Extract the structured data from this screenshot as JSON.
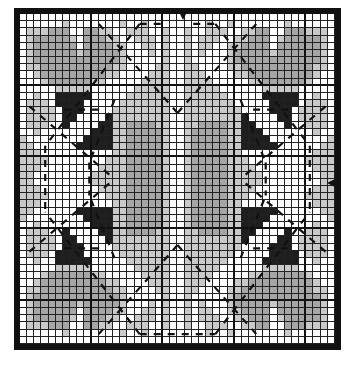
{
  "chart": {
    "title": "",
    "type": "cross-stitch-pattern-grid",
    "columns": 44,
    "rows": 46,
    "cell_px": 7.05,
    "major_grid_every": 10,
    "center_markers": [
      "top",
      "right"
    ],
    "colors": {
      "w": "#ffffff",
      "l": "#c9c9c9",
      "m": "#a6a6a6",
      "k": "#1e1e1e",
      "grid_line": "#222222",
      "border": "#111111",
      "dash": "#111111"
    },
    "legend": {
      "w": "white / background",
      "l": "light gray",
      "m": "medium gray",
      "k": "black"
    },
    "quadrant_rows": [
      "......................",
      "......l.......l..l....",
      ".lllmmm..mmll..lll..l.",
      ".lmmmmml.mmmll..lll.l.",
      ".lmmmmmm.mmmmll..ll.l.",
      ".lmmmmmmlmmmmml...l.l.",
      ".lmmmmmmmmmmmml.....l.",
      ".llmmmmmmmmmmll....ll.",
      "..lmmmmmmmmmll....lll.",
      "...lmmmmmmll.....llll.",
      ".....lllll......lllll.",
      "..l..kkkkk.....llllll.",
      ".lll.kkkk.....lllllll.",
      ".llll.kkk....llllllll.",
      ".llll.kk....kllllllll.",
      ".lll..k....kkllmmmmll.",
      "..l.......kkkllmmmmml.",
      "l........kkkkllmmmmml.",
      "ll......kkkkkllmmmmml.",
      "lll..........llmmmmml.",
      "llll........lllmmmmml.",
      "lll........llllmmmmml.",
      "ll........lllllmmmmml."
    ],
    "dashed_lines": [
      {
        "x1": 0.38,
        "y1": 0.03,
        "x2": 0.08,
        "y2": 0.4
      },
      {
        "x1": 0.62,
        "y1": 0.03,
        "x2": 0.92,
        "y2": 0.4
      },
      {
        "x1": 0.38,
        "y1": 0.97,
        "x2": 0.08,
        "y2": 0.6
      },
      {
        "x1": 0.62,
        "y1": 0.97,
        "x2": 0.92,
        "y2": 0.6
      },
      {
        "x1": 0.25,
        "y1": 0.03,
        "x2": 0.5,
        "y2": 0.3
      },
      {
        "x1": 0.75,
        "y1": 0.03,
        "x2": 0.5,
        "y2": 0.3
      },
      {
        "x1": 0.25,
        "y1": 0.97,
        "x2": 0.5,
        "y2": 0.7
      },
      {
        "x1": 0.75,
        "y1": 0.97,
        "x2": 0.5,
        "y2": 0.7
      },
      {
        "x1": 0.03,
        "y1": 0.28,
        "x2": 0.3,
        "y2": 0.5
      },
      {
        "x1": 0.03,
        "y1": 0.72,
        "x2": 0.3,
        "y2": 0.5
      },
      {
        "x1": 0.97,
        "y1": 0.28,
        "x2": 0.7,
        "y2": 0.5
      },
      {
        "x1": 0.97,
        "y1": 0.72,
        "x2": 0.7,
        "y2": 0.5
      },
      {
        "x1": 0.38,
        "y1": 0.03,
        "x2": 0.45,
        "y2": 0.03
      },
      {
        "x1": 0.55,
        "y1": 0.03,
        "x2": 0.62,
        "y2": 0.03
      },
      {
        "x1": 0.08,
        "y1": 0.4,
        "x2": 0.08,
        "y2": 0.6
      },
      {
        "x1": 0.92,
        "y1": 0.4,
        "x2": 0.92,
        "y2": 0.6
      },
      {
        "x1": 0.38,
        "y1": 0.97,
        "x2": 0.62,
        "y2": 0.97
      },
      {
        "x1": 0.14,
        "y1": 0.29,
        "x2": 0.26,
        "y2": 0.29
      },
      {
        "x1": 0.74,
        "y1": 0.29,
        "x2": 0.86,
        "y2": 0.29
      },
      {
        "x1": 0.14,
        "y1": 0.71,
        "x2": 0.26,
        "y2": 0.71
      },
      {
        "x1": 0.74,
        "y1": 0.71,
        "x2": 0.86,
        "y2": 0.71
      },
      {
        "x1": 0.3,
        "y1": 0.26,
        "x2": 0.22,
        "y2": 0.45
      },
      {
        "x1": 0.7,
        "y1": 0.26,
        "x2": 0.78,
        "y2": 0.45
      },
      {
        "x1": 0.3,
        "y1": 0.74,
        "x2": 0.22,
        "y2": 0.55
      },
      {
        "x1": 0.7,
        "y1": 0.74,
        "x2": 0.78,
        "y2": 0.55
      },
      {
        "x1": 0.22,
        "y1": 0.45,
        "x2": 0.22,
        "y2": 0.55
      },
      {
        "x1": 0.78,
        "y1": 0.45,
        "x2": 0.78,
        "y2": 0.55
      }
    ]
  }
}
